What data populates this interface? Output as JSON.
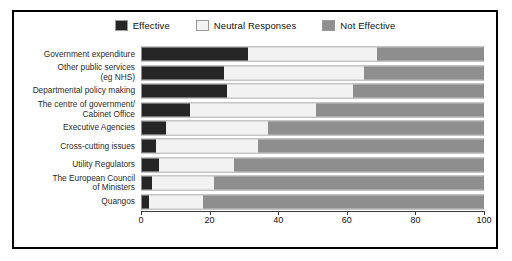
{
  "figure": {
    "background_color": "#ffffff",
    "border_color": "#000000"
  },
  "legend": {
    "position": "top-center",
    "entries": [
      {
        "label": "Effective",
        "color": "#262626",
        "swatch": "legend-swatch-effective"
      },
      {
        "label": "Neutral Responses",
        "color": "#f2f2f2",
        "swatch": "legend-swatch-neutral"
      },
      {
        "label": "Not Effective",
        "color": "#8e8e8e",
        "swatch": "legend-swatch-not-effective"
      }
    ]
  },
  "axis": {
    "ticks": [
      "0",
      "20",
      "40",
      "60",
      "80",
      "100"
    ],
    "min": 0,
    "max": 100
  },
  "chart_data": {
    "type": "bar",
    "orientation": "horizontal",
    "stacked": true,
    "stacked_percent": true,
    "title": "",
    "xlabel": "",
    "ylabel": "",
    "xlim": [
      0,
      100
    ],
    "grid": false,
    "legend_position": "top-center",
    "categories": [
      "Government expenditure",
      "Other public services\n(eg NHS)",
      "Departmental policy making",
      "The centre of government/\nCabinet Office",
      "Executive Agencies",
      "Cross-cutting issues",
      "Utility Regulators",
      "The European Council\nof Ministers",
      "Quangos"
    ],
    "series": [
      {
        "name": "Effective",
        "color": "#262626",
        "values": [
          31,
          24,
          25,
          14,
          7,
          4,
          5,
          3,
          2
        ]
      },
      {
        "name": "Neutral Responses",
        "color": "#f2f2f2",
        "values": [
          38,
          41,
          37,
          37,
          30,
          30,
          22,
          18,
          16
        ]
      },
      {
        "name": "Not Effective",
        "color": "#8e8e8e",
        "values": [
          31,
          35,
          38,
          49,
          63,
          66,
          73,
          79,
          82
        ]
      }
    ]
  }
}
